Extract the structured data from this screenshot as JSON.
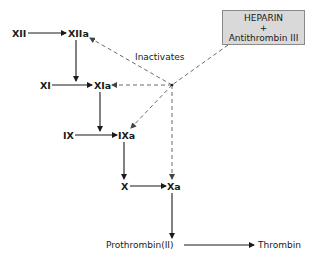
{
  "diagram": {
    "type": "coagulation-cascade",
    "nodes": {
      "xii": "XII",
      "xiia": "XIIa",
      "xi": "XI",
      "xia": "XIa",
      "ix": "IX",
      "ixa": "IXa",
      "x": "X",
      "xa": "Xa",
      "prothrombin": "Prothrombin(II)",
      "thrombin": "Thrombin"
    },
    "inhibitor_box": {
      "line1": "HEPARIN",
      "line2": "+",
      "line3": "Antithrombin III",
      "fill": "#d9d9d9"
    },
    "inhibit_label": "Inactivates",
    "edges": [
      {
        "from": "XII",
        "to": "XIIa",
        "style": "solid"
      },
      {
        "from": "XIIa",
        "to": "XIa",
        "style": "solid"
      },
      {
        "from": "XI",
        "to": "XIa",
        "style": "solid"
      },
      {
        "from": "XIa",
        "to": "IXa",
        "style": "solid"
      },
      {
        "from": "IX",
        "to": "IXa",
        "style": "solid"
      },
      {
        "from": "IXa",
        "to": "Xa",
        "style": "solid"
      },
      {
        "from": "X",
        "to": "Xa",
        "style": "solid"
      },
      {
        "from": "Xa",
        "to": "Prothrombin(II)",
        "style": "solid"
      },
      {
        "from": "Prothrombin(II)",
        "to": "Thrombin",
        "style": "solid"
      },
      {
        "from": "HEPARIN + Antithrombin III",
        "to": "XIIa",
        "style": "dashed"
      },
      {
        "from": "HEPARIN + Antithrombin III",
        "to": "XIa",
        "style": "dashed"
      },
      {
        "from": "HEPARIN + Antithrombin III",
        "to": "IXa",
        "style": "dashed"
      },
      {
        "from": "HEPARIN + Antithrombin III",
        "to": "Xa",
        "style": "dashed"
      }
    ]
  }
}
